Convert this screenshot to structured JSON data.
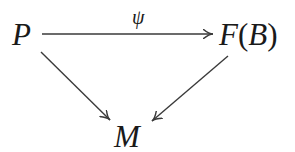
{
  "diagram": {
    "type": "commutative-diagram",
    "nodes": {
      "P": {
        "label": "P"
      },
      "FB": {
        "label_func": "F",
        "label_open": "(",
        "label_arg": "B",
        "label_close": ")"
      },
      "M": {
        "label": "M"
      }
    },
    "edges": [
      {
        "from": "P",
        "to": "F(B)",
        "label": "ψ"
      },
      {
        "from": "P",
        "to": "M",
        "label": ""
      },
      {
        "from": "F(B)",
        "to": "M",
        "label": ""
      }
    ],
    "colors": {
      "stroke": "#3a3a3a",
      "text": "#1a1a1a",
      "background": "#ffffff"
    }
  }
}
